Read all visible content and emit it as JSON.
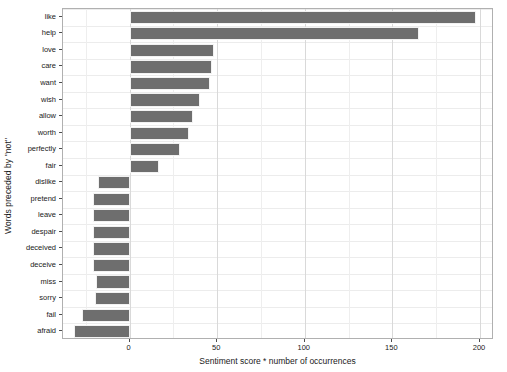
{
  "chart_data": {
    "type": "bar",
    "orientation": "horizontal",
    "title": "",
    "subtitle": "",
    "xlabel": "Sentiment score * number of occurrences",
    "ylabel": "Words preceded by \"not\"",
    "xlim": [
      -38,
      208
    ],
    "xticks": [
      0,
      50,
      100,
      150,
      200
    ],
    "xtick_labels": [
      "0",
      "50",
      "100",
      "150",
      "200"
    ],
    "grid": true,
    "legend": "none",
    "bar_color": "#6e6e6e",
    "panel_border_color": "#b0b0b0",
    "gridline_color": "#d9d9d9",
    "categories": [
      "like",
      "help",
      "love",
      "care",
      "want",
      "wish",
      "allow",
      "worth",
      "perfectly",
      "fair",
      "dislike",
      "pretend",
      "leave",
      "despair",
      "deceived",
      "deceive",
      "miss",
      "sorry",
      "fail",
      "afraid"
    ],
    "values": [
      198,
      165,
      48,
      47,
      46,
      40,
      36,
      34,
      29,
      17,
      -18,
      -21,
      -21,
      -21,
      -21,
      -21,
      -19,
      -20,
      -27,
      -32
    ]
  }
}
